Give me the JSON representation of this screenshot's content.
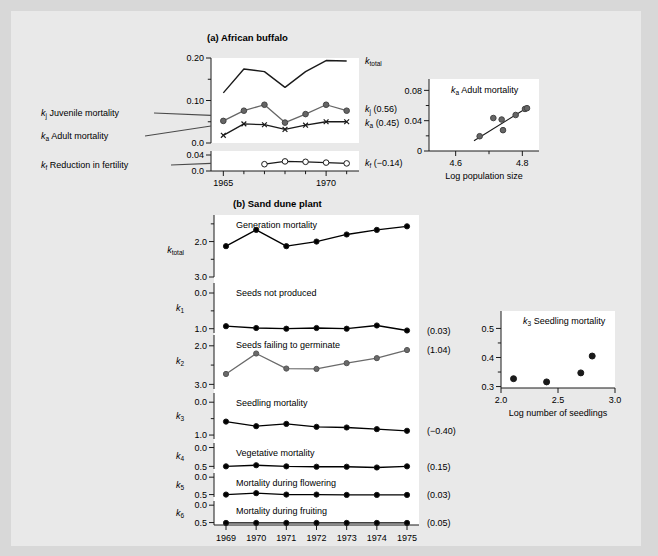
{
  "figure": {
    "background": "#e9e9e9",
    "panel_bg": "#ffffff"
  },
  "panel_a": {
    "title": "(a) African buffalo",
    "left_labels": [
      {
        "k": "k",
        "sub": "j",
        "text": " Juvenile mortality"
      },
      {
        "k": "k",
        "sub": "a",
        "text": " Adult mortality"
      },
      {
        "k": "k",
        "sub": "f",
        "text": " Reduction in fertility"
      }
    ],
    "main_axis": {
      "yticks": [
        "0.20",
        "0.10",
        "0.0"
      ],
      "ylim": [
        0.0,
        0.2
      ],
      "xticks": [
        "1965",
        "1970"
      ],
      "xlim": [
        1964.4,
        1971.6
      ]
    },
    "lower_axis": {
      "yticks": [
        "0.04",
        "0.0"
      ],
      "ylim": [
        0.0,
        0.05
      ]
    },
    "series_labels": [
      {
        "k": "k",
        "sub": "total",
        "value": ""
      },
      {
        "k": "k",
        "sub": "j",
        "value": " (0.56)"
      },
      {
        "k": "k",
        "sub": "a",
        "value": " (0.45)"
      },
      {
        "k": "k",
        "sub": "f",
        "value": " (−0.14)"
      }
    ],
    "inset": {
      "title_k": "k",
      "title_sub": "a",
      "title_text": " Adult mortality",
      "xlabel": "Log population size",
      "yticks": [
        "0.08",
        "0.04",
        "0"
      ],
      "ylim": [
        0.0,
        0.095
      ],
      "xticks": [
        "4.6",
        "4.8"
      ],
      "xlim": [
        4.52,
        4.85
      ]
    }
  },
  "panel_b": {
    "title": "(b) Sand dune plant",
    "xticks": [
      "1969",
      "1970",
      "1971",
      "1972",
      "1973",
      "1974",
      "1975"
    ],
    "rows": [
      {
        "k": "k",
        "sub": "total",
        "caption": "Generation mortality",
        "yticks": [
          "3.0",
          "2.0"
        ],
        "annotation": ""
      },
      {
        "k": "k",
        "sub": "1",
        "caption": "Seeds not produced",
        "yticks": [
          "1.0",
          "0.0"
        ],
        "annotation": "(0.03)"
      },
      {
        "k": "k",
        "sub": "2",
        "caption": "Seeds failing to germinate",
        "yticks": [
          "3.0",
          "2.0"
        ],
        "annotation": "(1.04)"
      },
      {
        "k": "k",
        "sub": "3",
        "caption": "Seedling mortality",
        "yticks": [
          "1.0",
          "0.0"
        ],
        "annotation": "(−0.40)"
      },
      {
        "k": "k",
        "sub": "4",
        "caption": "Vegetative mortality",
        "yticks": [
          "0.5",
          "0.0"
        ],
        "annotation": "(0.15)"
      },
      {
        "k": "k",
        "sub": "5",
        "caption": "Mortality during flowering",
        "yticks": [
          "0.5",
          "0.0"
        ],
        "annotation": "(0.03)"
      },
      {
        "k": "k",
        "sub": "6",
        "caption": "Mortality during fruiting",
        "yticks": [
          "0.5",
          "0.0"
        ],
        "annotation": "(0.05)"
      }
    ],
    "inset": {
      "title_k": "k",
      "title_sub": "3",
      "title_text": " Seedling mortality",
      "xlabel": "Log number of seedlings",
      "yticks": [
        "0.5",
        "0.4",
        "0.3"
      ],
      "ylim": [
        0.295,
        0.56
      ],
      "xticks": [
        "2.0",
        "2.5",
        "3.0"
      ],
      "xlim": [
        2.0,
        3.0
      ]
    }
  },
  "chart_data": [
    {
      "type": "line",
      "id": "buffalo-k-factors",
      "title": "(a) African buffalo",
      "xlabel": "",
      "ylabel": "",
      "x": [
        1965,
        1966,
        1967,
        1968,
        1969,
        1970,
        1971
      ],
      "xlim": [
        1964.4,
        1971.6
      ],
      "ylim": [
        0.0,
        0.205
      ],
      "grid": false,
      "series": [
        {
          "name": "k_total",
          "marker": "none",
          "color": "#000000",
          "values": [
            0.118,
            0.174,
            0.168,
            0.131,
            0.168,
            0.194,
            0.193
          ]
        },
        {
          "name": "k_j (0.56)",
          "marker": "filled-circle",
          "color": "#5a5a5a",
          "values": [
            0.052,
            0.076,
            0.09,
            0.048,
            0.068,
            0.09,
            0.076
          ]
        },
        {
          "name": "k_a (0.45)",
          "marker": "x",
          "color": "#000000",
          "values": [
            0.018,
            0.045,
            0.043,
            0.032,
            0.042,
            0.05,
            0.05
          ]
        }
      ]
    },
    {
      "type": "line",
      "id": "buffalo-kf",
      "title": "",
      "xlim": [
        1964.4,
        1971.6
      ],
      "ylim": [
        0.0,
        0.05
      ],
      "grid": false,
      "x": [
        1967,
        1968,
        1969,
        1970,
        1971
      ],
      "series": [
        {
          "name": "k_f (-0.14)",
          "marker": "open-circle",
          "color": "#000000",
          "values": [
            0.017,
            0.024,
            0.023,
            0.021,
            0.019
          ]
        }
      ]
    },
    {
      "type": "scatter",
      "id": "buffalo-adult-mortality-vs-popsize",
      "title": "k_a Adult mortality",
      "xlabel": "Log population size",
      "ylabel": "",
      "xlim": [
        4.52,
        4.85
      ],
      "ylim": [
        0.0,
        0.095
      ],
      "grid": false,
      "points": [
        {
          "x": 4.672,
          "y": 0.0195
        },
        {
          "x": 4.713,
          "y": 0.0435
        },
        {
          "x": 4.738,
          "y": 0.0415
        },
        {
          "x": 4.742,
          "y": 0.0275
        },
        {
          "x": 4.78,
          "y": 0.0475
        },
        {
          "x": 4.808,
          "y": 0.0555
        },
        {
          "x": 4.814,
          "y": 0.0565
        }
      ],
      "trendline": {
        "x0": 4.655,
        "y0": 0.0135,
        "x1": 4.812,
        "y1": 0.0565
      }
    },
    {
      "type": "line",
      "id": "sand-dune-ktotal",
      "title": "Generation mortality",
      "categories": [
        "1969",
        "1970",
        "1971",
        "1972",
        "1973",
        "1974",
        "1975"
      ],
      "ylim": [
        2.0,
        3.75
      ],
      "yticks": [
        2.0,
        3.0
      ],
      "grid": false,
      "color": "#000000",
      "marker": "filled-circle",
      "values": [
        2.87,
        3.33,
        2.87,
        3.0,
        3.2,
        3.33,
        3.43
      ],
      "annotation": ""
    },
    {
      "type": "line",
      "id": "sand-dune-k1",
      "title": "Seeds not produced",
      "categories": [
        "1969",
        "1970",
        "1971",
        "1972",
        "1973",
        "1974",
        "1975"
      ],
      "ylim": [
        -0.12,
        1.28
      ],
      "yticks": [
        0.0,
        1.0
      ],
      "grid": false,
      "color": "#000000",
      "marker": "filled-circle",
      "values": [
        0.07,
        0.02,
        0.0,
        0.02,
        0.0,
        0.09,
        -0.05
      ],
      "annotation": "(0.03)"
    },
    {
      "type": "line",
      "id": "sand-dune-k2",
      "title": "Seeds failing to germinate",
      "categories": [
        "1969",
        "1970",
        "1971",
        "1972",
        "1973",
        "1974",
        "1975"
      ],
      "ylim": [
        1.88,
        3.28
      ],
      "yticks": [
        2.0,
        3.0
      ],
      "grid": false,
      "color": "#6a6a6a",
      "marker": "filled-circle",
      "values": [
        2.27,
        2.8,
        2.41,
        2.4,
        2.55,
        2.68,
        2.89
      ],
      "annotation": "(1.04)"
    },
    {
      "type": "line",
      "id": "sand-dune-k3",
      "title": "Seedling mortality",
      "categories": [
        "1969",
        "1970",
        "1971",
        "1972",
        "1973",
        "1974",
        "1975"
      ],
      "ylim": [
        -0.12,
        1.28
      ],
      "yticks": [
        0.0,
        1.0
      ],
      "grid": false,
      "color": "#000000",
      "marker": "filled-circle",
      "values": [
        0.41,
        0.27,
        0.34,
        0.25,
        0.23,
        0.18,
        0.13
      ],
      "annotation": "(−0.40)"
    },
    {
      "type": "line",
      "id": "sand-dune-k4",
      "title": "Vegetative mortality",
      "categories": [
        "1969",
        "1970",
        "1971",
        "1972",
        "1973",
        "1974",
        "1975"
      ],
      "ylim": [
        -0.07,
        0.62
      ],
      "yticks": [
        0.0,
        0.5
      ],
      "grid": false,
      "color": "#000000",
      "marker": "filled-circle",
      "values": [
        0.0,
        0.03,
        0.0,
        -0.01,
        -0.01,
        -0.03,
        0.0
      ],
      "annotation": "(0.15)"
    },
    {
      "type": "line",
      "id": "sand-dune-k5",
      "title": "Mortality during flowering",
      "categories": [
        "1969",
        "1970",
        "1971",
        "1972",
        "1973",
        "1974",
        "1975"
      ],
      "ylim": [
        -0.07,
        0.62
      ],
      "yticks": [
        0.0,
        0.5
      ],
      "grid": false,
      "color": "#000000",
      "marker": "filled-circle",
      "values": [
        0.0,
        0.04,
        0.0,
        0.0,
        -0.01,
        -0.01,
        -0.01
      ],
      "annotation": "(0.03)"
    },
    {
      "type": "line",
      "id": "sand-dune-k6",
      "title": "Mortality during fruiting",
      "categories": [
        "1969",
        "1970",
        "1971",
        "1972",
        "1973",
        "1974",
        "1975"
      ],
      "ylim": [
        -0.07,
        0.62
      ],
      "yticks": [
        0.0,
        0.5
      ],
      "grid": false,
      "color": "#000000",
      "marker": "filled-circle",
      "values": [
        -0.01,
        -0.01,
        -0.01,
        -0.01,
        -0.01,
        -0.01,
        -0.01
      ],
      "annotation": "(0.05)"
    },
    {
      "type": "scatter",
      "id": "seedling-mortality-vs-seedlings",
      "title": "k_3 Seedling mortality",
      "xlabel": "Log number of seedlings",
      "ylabel": "",
      "xlim": [
        2.0,
        3.0
      ],
      "ylim": [
        0.295,
        0.56
      ],
      "grid": false,
      "points": [
        {
          "x": 2.11,
          "y": 0.327
        },
        {
          "x": 2.4,
          "y": 0.316
        },
        {
          "x": 2.7,
          "y": 0.347
        },
        {
          "x": 2.8,
          "y": 0.405
        }
      ]
    }
  ]
}
